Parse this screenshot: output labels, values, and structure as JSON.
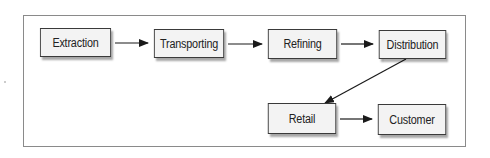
{
  "diagram": {
    "type": "flowchart",
    "nodes": [
      {
        "id": "extraction",
        "label": "Extraction",
        "x": 36,
        "y": 28,
        "w": 79,
        "h": 29
      },
      {
        "id": "transporting",
        "label": "Transporting",
        "x": 150,
        "y": 29,
        "w": 78,
        "h": 29
      },
      {
        "id": "refining",
        "label": "Refining",
        "x": 264,
        "y": 29,
        "w": 77,
        "h": 30
      },
      {
        "id": "distribution",
        "label": "Distribution",
        "x": 375,
        "y": 30,
        "w": 75,
        "h": 29
      },
      {
        "id": "retail",
        "label": "Retail",
        "x": 264,
        "y": 103,
        "w": 76,
        "h": 31
      },
      {
        "id": "customer",
        "label": "Customer",
        "x": 374,
        "y": 104,
        "w": 76,
        "h": 31
      }
    ],
    "edges": [
      {
        "from": "extraction",
        "to": "transporting"
      },
      {
        "from": "transporting",
        "to": "refining"
      },
      {
        "from": "refining",
        "to": "distribution"
      },
      {
        "from": "distribution",
        "to": "retail"
      },
      {
        "from": "retail",
        "to": "customer"
      }
    ]
  }
}
